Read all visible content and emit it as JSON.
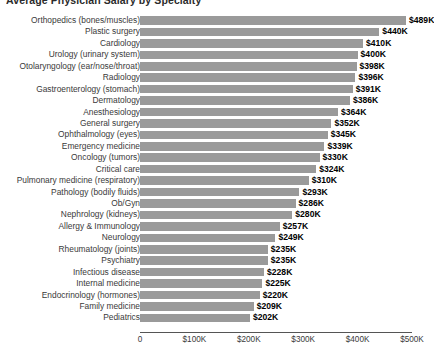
{
  "chart_data": {
    "type": "bar",
    "orientation": "horizontal",
    "title": "Average Physician Salary by Specialty",
    "xlabel": "",
    "ylabel": "",
    "xlim": [
      0,
      500
    ],
    "grid": false,
    "legend": false,
    "value_prefix": "$",
    "value_suffix": "K",
    "bar_color": "#9a9a9a",
    "axis_color": "#555555",
    "label_color": "#3a3a3a",
    "xticks": [
      0,
      100,
      200,
      300,
      400,
      500
    ],
    "xtick_labels": [
      "0",
      "$100K",
      "$200K",
      "$300K",
      "$400K",
      "$500K"
    ],
    "categories": [
      "Orthopedics (bones/muscles)",
      "Plastic surgery",
      "Cardiology",
      "Urology (urinary system)",
      "Otolaryngology (ear/nose/throat)",
      "Radiology",
      "Gastroenterology (stomach)",
      "Dermatology",
      "Anesthesiology",
      "General surgery",
      "Ophthalmology (eyes)",
      "Emergency medicine",
      "Oncology (tumors)",
      "Critical care",
      "Pulmonary medicine (respiratory)",
      "Pathology (bodily fluids)",
      "Ob/Gyn",
      "Nephrology (kidneys)",
      "Allergy & Immunology",
      "Neurology",
      "Rheumatology (joints)",
      "Psychiatry",
      "Infectious disease",
      "Internal medicine",
      "Endocrinology (hormones)",
      "Family medicine",
      "Pediatrics"
    ],
    "values": [
      489,
      440,
      410,
      400,
      398,
      396,
      391,
      386,
      364,
      352,
      345,
      339,
      330,
      324,
      310,
      293,
      286,
      280,
      257,
      249,
      235,
      235,
      228,
      225,
      220,
      209,
      202
    ],
    "value_labels": [
      "$489K",
      "$440K",
      "$410K",
      "$400K",
      "$398K",
      "$396K",
      "$391K",
      "$386K",
      "$364K",
      "$352K",
      "$345K",
      "$339K",
      "$330K",
      "$324K",
      "$310K",
      "$293K",
      "$286K",
      "$280K",
      "$257K",
      "$249K",
      "$235K",
      "$235K",
      "$228K",
      "$225K",
      "$220K",
      "$209K",
      "$202K"
    ]
  }
}
